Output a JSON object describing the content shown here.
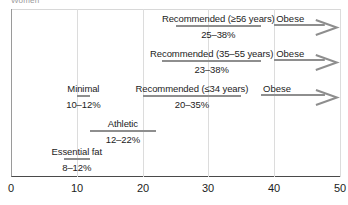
{
  "caption": "Women",
  "chart_data": {
    "type": "bar",
    "title": "Women",
    "xlabel": "",
    "ylabel": "",
    "xlim": [
      0,
      50
    ],
    "xticks": [
      0,
      10,
      20,
      30,
      40,
      50
    ],
    "xtick_labels": [
      "0",
      "10",
      "20",
      "30",
      "40",
      "50"
    ],
    "grid": true,
    "legend": "none",
    "orientation": "horizontal",
    "unit": "% body fat",
    "bar_color": "#8e8e8e",
    "axis_color": "#4a4a4a",
    "grid_color": "#dcdcdc",
    "categories": [
      {
        "label": "Recommended (≥56 years)",
        "value": "25–38%",
        "start": 25,
        "end": 38,
        "row": 0,
        "obese": {
          "label": "Obese",
          "start": 40,
          "end": 50,
          "open_ended": true
        }
      },
      {
        "label": "Recommended (35–55 years)",
        "value": "23–38%",
        "start": 23,
        "end": 38,
        "row": 1,
        "obese": {
          "label": "Obese",
          "start": 40,
          "end": 50,
          "open_ended": true
        }
      },
      {
        "label": "Recommended (≤34 years)",
        "value": "20–35%",
        "start": 20,
        "end": 35,
        "row": 2,
        "obese": {
          "label": "Obese",
          "start": 38,
          "end": 50,
          "open_ended": true
        }
      },
      {
        "label": "Minimal",
        "value": "10–12%",
        "start": 10,
        "end": 12,
        "row": 2,
        "obese": null
      },
      {
        "label": "Athletic",
        "value": "12–22%",
        "start": 12,
        "end": 22,
        "row": 3,
        "obese": null
      },
      {
        "label": "Essential fat",
        "value": "8–12%",
        "start": 8,
        "end": 12,
        "row": 4,
        "obese": null
      }
    ]
  }
}
